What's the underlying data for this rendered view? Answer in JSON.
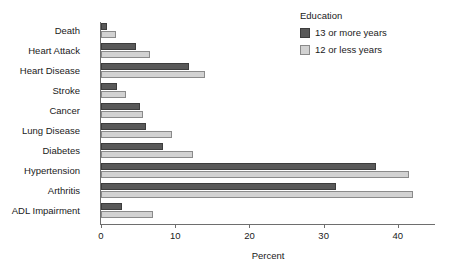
{
  "chart_data": {
    "type": "bar",
    "orientation": "horizontal",
    "title": "",
    "xlabel": "Percent",
    "ylabel": "",
    "xlim": [
      0,
      45
    ],
    "xticks": [
      0,
      10,
      20,
      30,
      40
    ],
    "grid": false,
    "legend": {
      "title": "Education",
      "position": "top-right"
    },
    "categories": [
      "Death",
      "Heart Attack",
      "Heart Disease",
      "Stroke",
      "Cancer",
      "Lung Disease",
      "Diabetes",
      "Hypertension",
      "Arthritis",
      "ADL Impairment"
    ],
    "series": [
      {
        "name": "13 or more years",
        "color": "#595959",
        "values": [
          0.8,
          4.7,
          11.8,
          2.2,
          5.2,
          6.0,
          8.4,
          37.0,
          31.6,
          2.8
        ]
      },
      {
        "name": "12 or less years",
        "color": "#d2d2d2",
        "values": [
          2.0,
          6.6,
          14.0,
          3.4,
          5.7,
          9.5,
          12.4,
          41.5,
          42.0,
          7.0
        ]
      }
    ]
  }
}
